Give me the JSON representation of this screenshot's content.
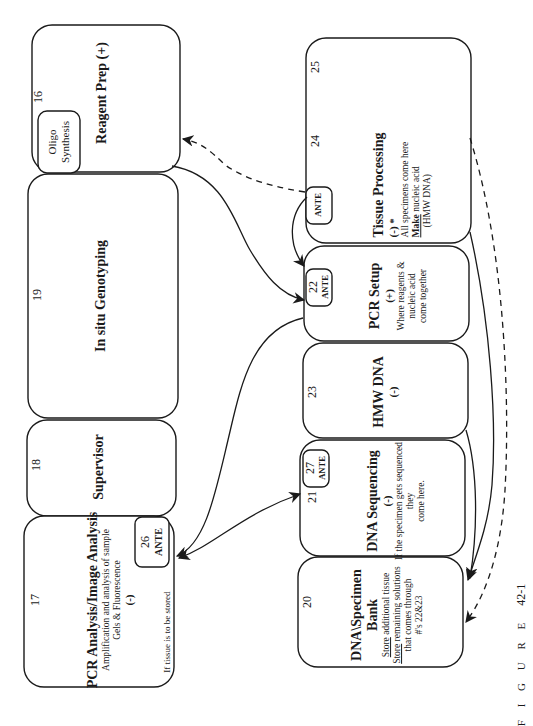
{
  "figure_caption": {
    "label": "F I G U R E",
    "number": "42-1"
  },
  "boxes": {
    "reagent_prep": {
      "number": "16",
      "title": "Reagent Prep (+)",
      "inner_box": "Oligo Synthesis",
      "inner_line1": "Oligo",
      "inner_line2": "Synthesis"
    },
    "in_situ": {
      "number": "19",
      "title": "In situ Genotyping"
    },
    "supervisor": {
      "number": "18",
      "title": "Supervisor"
    },
    "pcr_analysis": {
      "number": "17",
      "title": "PCR Analysis/Image Analysis",
      "line1": "Amplification and analysis of sample",
      "line2": "Gels & Fluorescence",
      "sign": "(-)",
      "note": "If tissue is to be stored",
      "ante_number": "26",
      "ante_label": "ANTE"
    },
    "tissue_processing": {
      "number_a": "25",
      "number_b": "24",
      "title": "Tissue Processing",
      "sign": "(-)  *",
      "line1": "All specimens come here",
      "line2_u": "Make",
      "line2_rest": " nucleic acid",
      "line3": "(HMW DNA)",
      "ante_label": "ANTE"
    },
    "pcr_setup": {
      "number": "22",
      "title": "PCR Setup",
      "sign": "(+)",
      "line1": "Where reagents &",
      "line2": "nucleic acid",
      "line3": "come together",
      "ante_label": "ANTE"
    },
    "hmw_dna": {
      "number": "23",
      "title": "HMW DNA",
      "sign": "(-)"
    },
    "dna_sequencing": {
      "number": "21",
      "title": "DNA Sequencing",
      "sign": "(-)",
      "line1": "If the specimen gets sequenced",
      "line2": "they",
      "line3": "come here.",
      "ante_number": "27",
      "ante_label": "ANTE"
    },
    "specimen_bank": {
      "number": "20",
      "title1": "DNA\\Specimen",
      "title2": "Bank",
      "line1_u": "Store",
      "line1_rest": " additional tissue",
      "line2_u": "Store",
      "line2_rest": " remaining solutions",
      "line3": "that comes through",
      "line4": "#'s 22&23"
    }
  },
  "connections": [
    {
      "from": "tissue_processing_ante",
      "to": "reagent_prep",
      "style": "dashed"
    },
    {
      "from": "tissue_processing_ante",
      "to": "pcr_setup",
      "style": "solid"
    },
    {
      "from": "reagent_prep",
      "to": "pcr_setup",
      "style": "solid"
    },
    {
      "from": "pcr_setup",
      "to": "pcr_analysis",
      "style": "solid"
    },
    {
      "from": "pcr_analysis",
      "to": "dna_sequencing",
      "style": "solid-bidirectional"
    },
    {
      "from": "tissue_processing",
      "to": "specimen_bank",
      "style": "solid"
    },
    {
      "from": "hmw_dna",
      "to": "specimen_bank",
      "style": "solid"
    },
    {
      "from": "tissue_processing",
      "to": "specimen_bank",
      "style": "dashed"
    }
  ]
}
